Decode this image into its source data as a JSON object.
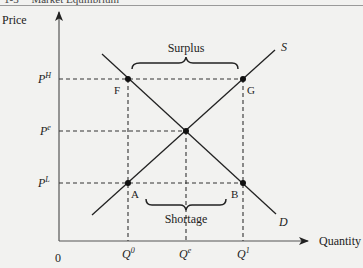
{
  "header": {
    "section_number": "1-3",
    "section_title": "Market Equilibrium"
  },
  "axes": {
    "y_label": "Price",
    "x_label": "Quantity",
    "origin_label": "0"
  },
  "price_levels": {
    "high": {
      "base": "P",
      "sup": "H"
    },
    "equilibrium": {
      "base": "P",
      "sup": "e"
    },
    "low": {
      "base": "P",
      "sup": "L"
    }
  },
  "quantity_levels": {
    "q0": {
      "base": "Q",
      "sup": "0"
    },
    "qe": {
      "base": "Q",
      "sup": "e"
    },
    "q1": {
      "base": "Q",
      "sup": "1"
    }
  },
  "curves": {
    "supply_label": "S",
    "demand_label": "D"
  },
  "points": {
    "F": "F",
    "G": "G",
    "A": "A",
    "B": "B"
  },
  "annotations": {
    "surplus": "Surplus",
    "shortage": "Shortage"
  },
  "colors": {
    "line": "#222222",
    "axis": "#555555",
    "dashed": "#333333",
    "background": "#f2f2f0"
  }
}
